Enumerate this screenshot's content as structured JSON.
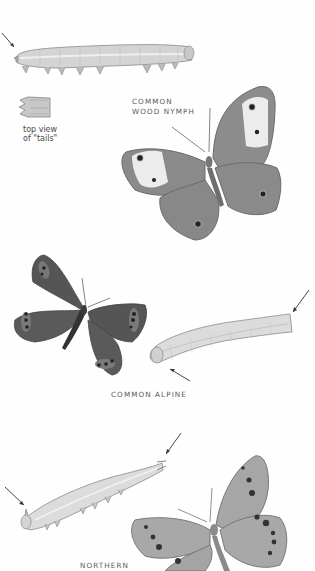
{
  "page": {
    "background": "#fefefe",
    "illustration_tone": "#8a8a8a"
  },
  "species": [
    {
      "name_line1": "COMMON",
      "name_line2": "WOOD NYMPH",
      "figures": [
        "caterpillar-side-view",
        "tails-top-view",
        "adult-butterfly"
      ],
      "caption_line1": "top view",
      "caption_line2": "of \"tails\""
    },
    {
      "name_line1": "COMMON ALPINE",
      "figures": [
        "adult-butterfly",
        "caterpillar-side-view"
      ]
    },
    {
      "name_line1": "NORTHERN",
      "figures": [
        "caterpillar-side-view",
        "adult-butterfly"
      ]
    }
  ]
}
